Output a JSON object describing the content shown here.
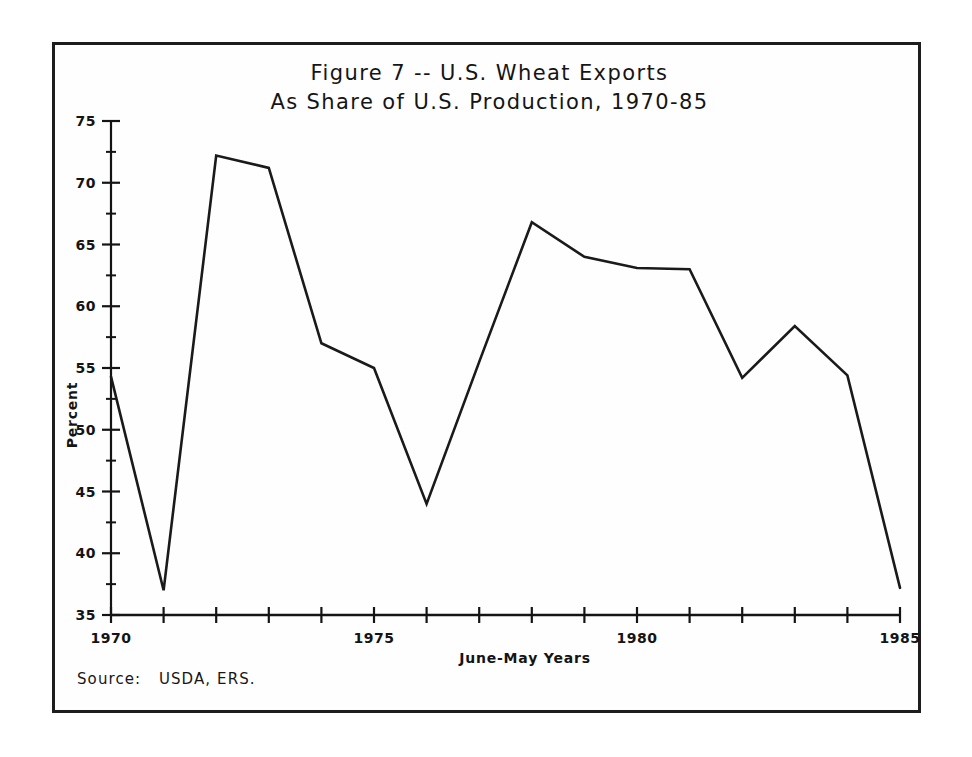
{
  "figure": {
    "title_line_1": "Figure 7 -- U.S. Wheat Exports",
    "title_line_2": "As Share of U.S. Production, 1970-85",
    "source": "Source:   USDA, ERS."
  },
  "chart_data": {
    "type": "line",
    "title": "Figure 7 -- U.S. Wheat Exports As Share of U.S. Production, 1970-85",
    "xlabel": "June-May Years",
    "ylabel": "Percent",
    "xlim": [
      1970,
      1985
    ],
    "ylim": [
      35,
      75
    ],
    "grid": false,
    "legend": null,
    "x_major_ticks": [
      1970,
      1975,
      1980,
      1985
    ],
    "x_major_tick_labels": [
      "1970",
      "1975",
      "1980",
      "1985"
    ],
    "x_minor_tick_step": 1,
    "y_major_ticks": [
      35,
      40,
      45,
      50,
      55,
      60,
      65,
      70,
      75
    ],
    "y_major_tick_labels": [
      "35",
      "40",
      "45",
      "50",
      "55",
      "60",
      "65",
      "70",
      "75"
    ],
    "y_minor_tick_step": 2.5,
    "x": [
      1970,
      1971,
      1972,
      1973,
      1974,
      1975,
      1976,
      1977,
      1978,
      1979,
      1980,
      1981,
      1982,
      1983,
      1984,
      1985
    ],
    "values": [
      54.3,
      37.0,
      72.2,
      71.2,
      57.0,
      55.0,
      44.0,
      55.5,
      66.8,
      64.0,
      63.1,
      63.0,
      54.2,
      58.4,
      54.4,
      37.2
    ],
    "series": [
      {
        "name": "U.S. wheat exports as share of U.S. production",
        "units": "percent",
        "values": [
          54.3,
          37.0,
          72.2,
          71.2,
          57.0,
          55.0,
          44.0,
          55.5,
          66.8,
          64.0,
          63.1,
          63.0,
          54.2,
          58.4,
          54.4,
          37.2
        ]
      }
    ],
    "line_color": "#1a1a1a"
  }
}
